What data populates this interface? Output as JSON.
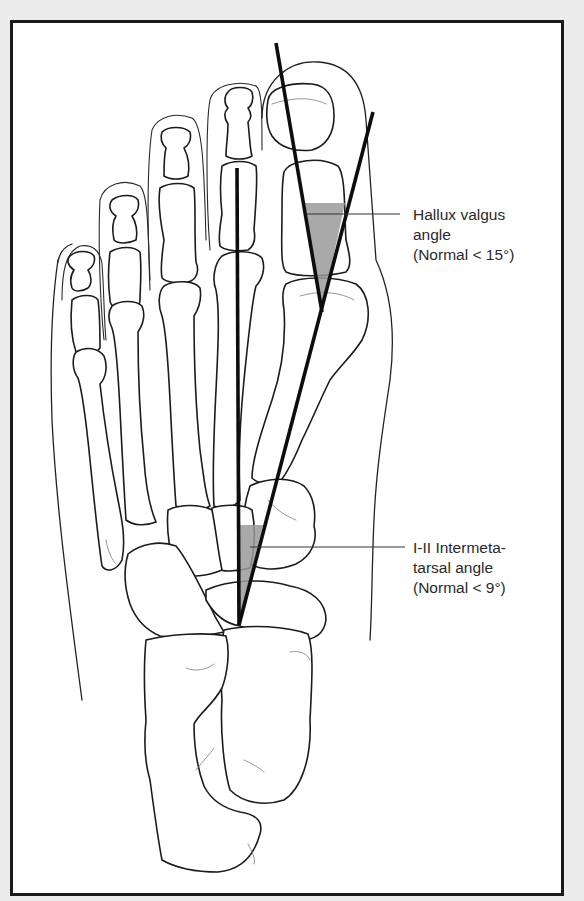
{
  "figure": {
    "background": "#ececec",
    "frame_color": "#1a1a1a",
    "panel_color": "#ffffff"
  },
  "annotations": [
    {
      "id": "hallux-valgus",
      "lines": [
        "Hallux valgus",
        "angle",
        "(Normal < 15°)"
      ],
      "text": "Hallux valgus\nangle\n(Normal < 15°)",
      "normal_limit_degrees": 15
    },
    {
      "id": "intermetatarsal",
      "lines": [
        "I-II Intermeta-",
        "tarsal angle",
        "(Normal < 9°)"
      ],
      "text": "I-II Intermeta-\ntarsal angle\n(Normal < 9°)",
      "normal_limit_degrees": 9
    }
  ],
  "angle_lines": {
    "hallux_proximal_phalanx_axis": {
      "x1": 276,
      "y1": 43,
      "x2": 322,
      "y2": 312
    },
    "first_metatarsal_axis": {
      "x1": 373,
      "y1": 112,
      "x2": 239,
      "y2": 625
    },
    "second_metatarsal_axis": {
      "x1": 237,
      "y1": 168,
      "x2": 239,
      "y2": 625
    }
  },
  "leaders": {
    "hallux_valgus": {
      "x1": 307,
      "y1": 214,
      "x2": 400,
      "y2": 214
    },
    "intermetatarsal": {
      "x1": 250,
      "y1": 547,
      "x2": 405,
      "y2": 547
    }
  }
}
